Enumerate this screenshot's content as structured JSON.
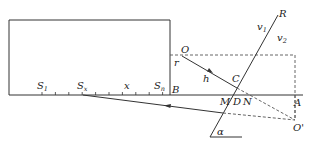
{
  "diagram": {
    "type": "optics-geometry",
    "labels": {
      "S1": {
        "main": "S",
        "sub": "1"
      },
      "Sx": {
        "main": "S",
        "sub": "x"
      },
      "x": "x",
      "Sn": {
        "main": "S",
        "sub": "n"
      },
      "B": "B",
      "r": "r",
      "O": "O",
      "h": "h",
      "C": "C",
      "R": "R",
      "v1": {
        "main": "v",
        "sub": "1"
      },
      "v2": {
        "main": "v",
        "sub": "2"
      },
      "M": "M",
      "D": "D",
      "N": "N",
      "A": "A",
      "O_prime": "O'",
      "alpha": "α"
    },
    "colors": {
      "line": "#333333",
      "dashed": "#555555",
      "text": "#222222"
    }
  }
}
